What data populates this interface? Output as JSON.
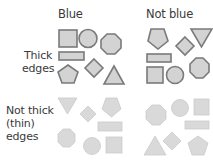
{
  "columns": [
    {
      "label": "Blue"
    },
    {
      "label": "Not blue"
    }
  ],
  "rows": [
    {
      "label_line1": "Thick",
      "label_line2": "edges",
      "label_line3": ""
    },
    {
      "label_line1": "Not thick",
      "label_line2": "(thin)",
      "label_line3": "edges"
    }
  ],
  "colors": {
    "thick_fill": "#d3d3d3",
    "thick_stroke": "#7a7a7a",
    "thin_fill": "#d9d9d9",
    "thin_stroke": "#c8c8c8",
    "text": "#3a3a3a"
  },
  "quadrants": {
    "blue_thick": {
      "shapes": [
        "square",
        "circle",
        "octagon",
        "rectangle",
        "diamond",
        "pentagon",
        "triangle-up"
      ]
    },
    "notblue_thick": {
      "shapes": [
        "pentagon",
        "diamond",
        "triangle-down",
        "rectangle",
        "square",
        "circle",
        "octagon"
      ]
    },
    "blue_thin": {
      "shapes": [
        "triangle-down",
        "diamond",
        "pentagon",
        "rectangle",
        "octagon",
        "circle",
        "square"
      ]
    },
    "notblue_thin": {
      "shapes": [
        "octagon",
        "circle",
        "square",
        "rectangle",
        "diamond",
        "triangle-up",
        "pentagon"
      ]
    }
  },
  "footer_clipped": ""
}
